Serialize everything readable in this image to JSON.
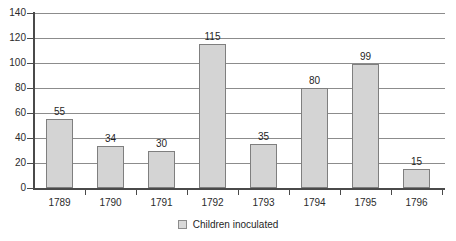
{
  "chart_data": {
    "type": "bar",
    "title": "",
    "subtitle": "",
    "xlabel": "",
    "ylabel": "",
    "categories": [
      "1789",
      "1790",
      "1791",
      "1792",
      "1793",
      "1794",
      "1795",
      "1796"
    ],
    "values": [
      55,
      34,
      30,
      115,
      35,
      80,
      99,
      15
    ],
    "data_labels": [
      "55",
      "34",
      "30",
      "115",
      "35",
      "80",
      "99",
      "15"
    ],
    "series": [
      {
        "name": "Children inoculated",
        "values": [
          55,
          34,
          30,
          115,
          35,
          80,
          99,
          15
        ]
      }
    ],
    "ylim": [
      0,
      140
    ],
    "y_ticks": [
      0,
      20,
      40,
      60,
      80,
      100,
      120,
      140
    ],
    "y_tick_labels": [
      "0",
      "20",
      "40",
      "60",
      "80",
      "100",
      "120",
      "140"
    ],
    "grid": true,
    "grid_axis": "y",
    "legend": {
      "position": "bottom",
      "entries": [
        {
          "label": "Children inoculated",
          "swatch_color": "#d9d9d9"
        }
      ]
    },
    "colors": {
      "bar_fill": "#d4d4d4",
      "bar_border": "#7f7f7f",
      "gridline": "#8c8c8c",
      "axis": "#4a4a4a",
      "text": "#1f1f1f",
      "background": "#ffffff"
    }
  }
}
